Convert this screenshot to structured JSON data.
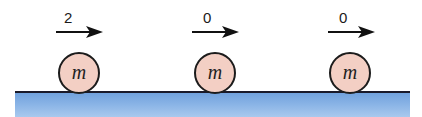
{
  "diagram": {
    "ball_label": "m",
    "colors": {
      "ball_fill": "#f3cfc4",
      "ball_outline": "#1c1c1c",
      "ground_fill": "#8ab4e6",
      "ground_line": "#1a1a2a",
      "arrow": "#111111"
    },
    "balls": [
      {
        "label": "m",
        "velocity": "2",
        "center_x": 79
      },
      {
        "label": "m",
        "velocity": "0",
        "center_x": 215
      },
      {
        "label": "m",
        "velocity": "0",
        "center_x": 350
      }
    ]
  }
}
